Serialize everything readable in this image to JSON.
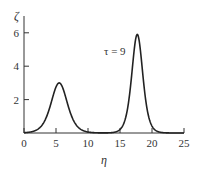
{
  "chart_data": {
    "type": "line",
    "title": "",
    "xlabel": "η",
    "ylabel": "ζ",
    "xlim": [
      0,
      25
    ],
    "ylim": [
      0,
      6.5
    ],
    "grid": false,
    "legend": "none",
    "x_ticks": [
      0,
      5,
      10,
      15,
      20,
      25
    ],
    "y_ticks": [
      2,
      4,
      6
    ],
    "x_tick_labels": [
      "0",
      "5",
      "10",
      "15",
      "20",
      "25"
    ],
    "y_tick_labels": [
      "2",
      "4",
      "6"
    ],
    "annotations": [
      {
        "text": "τ = 9",
        "x": 13.2,
        "y": 4.7
      }
    ],
    "series": [
      {
        "name": "τ = 9",
        "description": "two-soliton profile",
        "peaks": [
          {
            "x": 5.5,
            "y": 3.0,
            "width": 1.7
          },
          {
            "x": 17.7,
            "y": 5.9,
            "width": 1.15
          }
        ],
        "x": [
          0,
          1,
          2,
          3,
          4,
          5,
          5.5,
          6,
          7,
          8,
          9,
          10,
          11,
          12,
          13,
          14,
          15,
          16,
          17,
          17.7,
          18,
          19,
          20,
          21,
          22,
          23,
          24,
          25
        ],
        "y": [
          0.08,
          0.2,
          0.55,
          1.3,
          2.3,
          2.95,
          3.0,
          2.9,
          2.2,
          1.2,
          0.55,
          0.22,
          0.08,
          0.03,
          0.05,
          0.2,
          0.8,
          2.6,
          5.2,
          5.9,
          5.7,
          3.4,
          1.1,
          0.35,
          0.1,
          0.03,
          0.01,
          0.0
        ]
      }
    ]
  },
  "axes": {
    "x_label": "η",
    "y_label": "ζ",
    "annotation": "τ = 9"
  }
}
